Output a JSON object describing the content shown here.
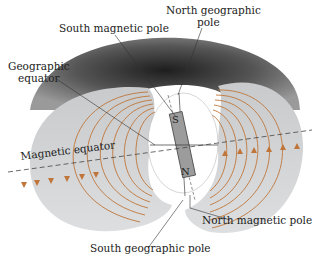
{
  "diagram": {
    "labels": {
      "south_magnetic_pole": "South magnetic pole",
      "north_geographic_pole_1": "North geographic",
      "north_geographic_pole_2": "pole",
      "geographic_equator_1": "Geographic",
      "geographic_equator_2": "equator",
      "magnetic_equator": "Magnetic equator",
      "north_magnetic_pole": "North magnetic pole",
      "south_geographic_pole": "South geographic pole",
      "magnet_s": "S",
      "magnet_n": "N"
    },
    "colors": {
      "field_line": "#c0763a",
      "torus_dark": "#2a2a2a",
      "torus_light": "#d4d6d8",
      "leader_line": "#333333"
    }
  }
}
